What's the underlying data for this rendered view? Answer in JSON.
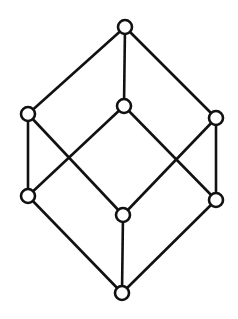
{
  "diagram": {
    "type": "hasse-diagram",
    "colors": {
      "stroke": "#111111",
      "node_fill": "#ffffff",
      "background": "#ffffff"
    },
    "nodes": [
      {
        "id": "top",
        "x": 125,
        "y": 27
      },
      {
        "id": "mid-left",
        "x": 28,
        "y": 114
      },
      {
        "id": "mid-center",
        "x": 124,
        "y": 106
      },
      {
        "id": "mid-right",
        "x": 216,
        "y": 118
      },
      {
        "id": "low-left",
        "x": 28,
        "y": 196
      },
      {
        "id": "low-center",
        "x": 123,
        "y": 215
      },
      {
        "id": "low-right",
        "x": 216,
        "y": 200
      },
      {
        "id": "bottom",
        "x": 122,
        "y": 293
      }
    ],
    "edges": [
      [
        "top",
        "mid-left"
      ],
      [
        "top",
        "mid-center"
      ],
      [
        "top",
        "mid-right"
      ],
      [
        "mid-left",
        "low-left"
      ],
      [
        "mid-left",
        "low-center"
      ],
      [
        "mid-center",
        "low-left"
      ],
      [
        "mid-center",
        "low-right"
      ],
      [
        "mid-right",
        "low-center"
      ],
      [
        "mid-right",
        "low-right"
      ],
      [
        "low-left",
        "bottom"
      ],
      [
        "low-center",
        "bottom"
      ],
      [
        "low-right",
        "bottom"
      ]
    ]
  }
}
